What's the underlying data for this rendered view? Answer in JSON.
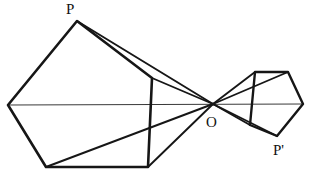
{
  "figure": {
    "background_color": "#ffffff",
    "stroke_color": "#161616",
    "thin_stroke_color": "#3a3a3a",
    "width": 310,
    "height": 176,
    "labels": {
      "p": "P",
      "o": "O",
      "p_prime": "P'"
    },
    "points": {
      "O": [
        213,
        104
      ],
      "P": [
        77,
        21
      ],
      "P_prime": [
        277,
        136
      ],
      "left_polygon": {
        "apex_P": [
          77,
          21
        ],
        "left": [
          8,
          105
        ],
        "bottom_left": [
          46,
          167
        ],
        "bottom_right": [
          148,
          167
        ],
        "right_top": [
          152,
          78
        ]
      },
      "right_polygon": {
        "top_left": [
          255,
          72
        ],
        "top_right": [
          288,
          72
        ],
        "right": [
          303,
          104
        ],
        "bottom_Pprime": [
          277,
          136
        ],
        "left_mid": [
          250,
          125
        ]
      }
    },
    "edges": {
      "left_polygon_outline": [
        [
          77,
          21
        ],
        [
          8,
          105
        ],
        [
          46,
          167
        ],
        [
          148,
          167
        ],
        [
          152,
          78
        ],
        [
          77,
          21
        ]
      ],
      "right_polygon_outline": [
        [
          255,
          72
        ],
        [
          288,
          72
        ],
        [
          303,
          104
        ],
        [
          277,
          136
        ],
        [
          250,
          125
        ],
        [
          255,
          72
        ]
      ],
      "axis_line": [
        [
          8,
          105
        ],
        [
          303,
          104
        ]
      ],
      "rays_from_O": [
        [
          [
            213,
            104
          ],
          [
            77,
            21
          ]
        ],
        [
          [
            213,
            104
          ],
          [
            152,
            78
          ]
        ],
        [
          [
            213,
            104
          ],
          [
            46,
            167
          ]
        ],
        [
          [
            213,
            104
          ],
          [
            148,
            167
          ]
        ],
        [
          [
            213,
            104
          ],
          [
            255,
            72
          ]
        ],
        [
          [
            213,
            104
          ],
          [
            288,
            72
          ]
        ],
        [
          [
            213,
            104
          ],
          [
            250,
            125
          ]
        ],
        [
          [
            213,
            104
          ],
          [
            277,
            136
          ]
        ]
      ]
    }
  }
}
